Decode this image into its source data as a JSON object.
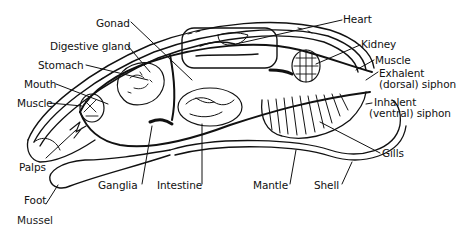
{
  "diagram": {
    "caption": "Mussel",
    "labels": {
      "gonad": "Gonad",
      "digestive_gland": "Digestive gland",
      "stomach": "Stomach",
      "mouth": "Mouth",
      "muscle_anterior": "Muscle",
      "palps": "Palps",
      "foot": "Foot",
      "ganglia": "Ganglia",
      "intestine": "Intestine",
      "mantle": "Mantle",
      "shell": "Shell",
      "gills": "Gills",
      "heart": "Heart",
      "kidney": "Kidney",
      "muscle_posterior": "Muscle",
      "exhalent_line1": "Exhalent",
      "exhalent_line2": "(dorsal) siphon",
      "inhalent_line1": "Inhalent",
      "inhalent_line2": "(ventral) siphon"
    },
    "colors": {
      "ink": "#111111",
      "background": "#ffffff"
    }
  }
}
